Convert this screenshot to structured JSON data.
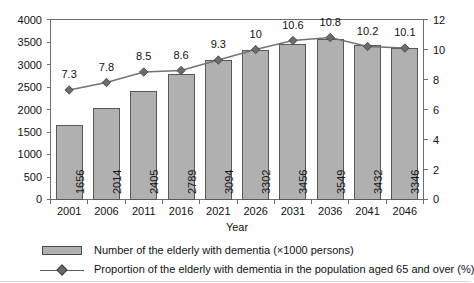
{
  "chart_data": {
    "type": "bar",
    "title": "",
    "xlabel": "Year",
    "ylabel": "",
    "categories": [
      "2001",
      "2006",
      "2011",
      "2016",
      "2021",
      "2026",
      "2031",
      "2036",
      "2041",
      "2046"
    ],
    "ylim": [
      0,
      4000
    ],
    "y2lim": [
      0,
      12
    ],
    "yticks": [
      "0",
      "500",
      "1000",
      "1500",
      "2000",
      "2500",
      "3000",
      "3500",
      "4000"
    ],
    "y2ticks": [
      "0",
      "2",
      "4",
      "6",
      "8",
      "10",
      "12"
    ],
    "grid": false,
    "legend_position": "bottom",
    "series": [
      {
        "name": "Number of the elderly with dementia (×1000 persons)",
        "type": "bar",
        "axis": "left",
        "color": "#b0b0b0",
        "values": [
          1656,
          2014,
          2405,
          2789,
          3094,
          3302,
          3456,
          3549,
          3432,
          3346
        ],
        "labels": [
          "1656",
          "2014",
          "2405",
          "2789",
          "3094",
          "3302",
          "3456",
          "3549",
          "3432",
          "3346"
        ]
      },
      {
        "name": "Proportion of the elderly with dementia in the population aged 65 and over (%)",
        "type": "line",
        "axis": "right",
        "color": "#6b6b6b",
        "values": [
          7.3,
          7.8,
          8.5,
          8.6,
          9.3,
          10,
          10.6,
          10.8,
          10.2,
          10.1
        ],
        "labels": [
          "7.3",
          "7.8",
          "8.5",
          "8.6",
          "9.3",
          "10",
          "10.6",
          "10.8",
          "10.2",
          "10.1"
        ]
      }
    ]
  },
  "legend": {
    "items": [
      {
        "label": "Number of the elderly with dementia (×1000 persons)",
        "key": "bar-swatch"
      },
      {
        "label": "Proportion of the elderly with dementia in the population aged 65 and over (%)",
        "key": "line-marker"
      }
    ]
  },
  "axes": {
    "x_title": "Year"
  }
}
